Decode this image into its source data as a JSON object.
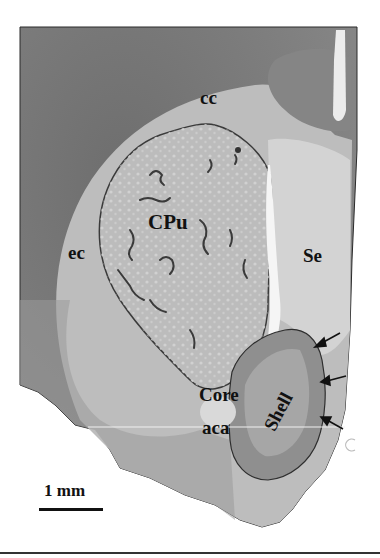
{
  "figure": {
    "type": "histology-micrograph",
    "labels": {
      "cc": "cc",
      "ec": "ec",
      "cpu": "CPu",
      "se": "Se",
      "core": "Core",
      "aca": "aca",
      "shell": "Shell"
    },
    "arrows_count": 3,
    "scale_bar": {
      "label": "1 mm"
    },
    "colors": {
      "cortex": "#7a7a7a",
      "white_matter": "#c8c8c8",
      "striatum": "#b8b8b8",
      "septum": "#d2d2d2",
      "background": "#ffffff",
      "ink": "#111111"
    }
  }
}
